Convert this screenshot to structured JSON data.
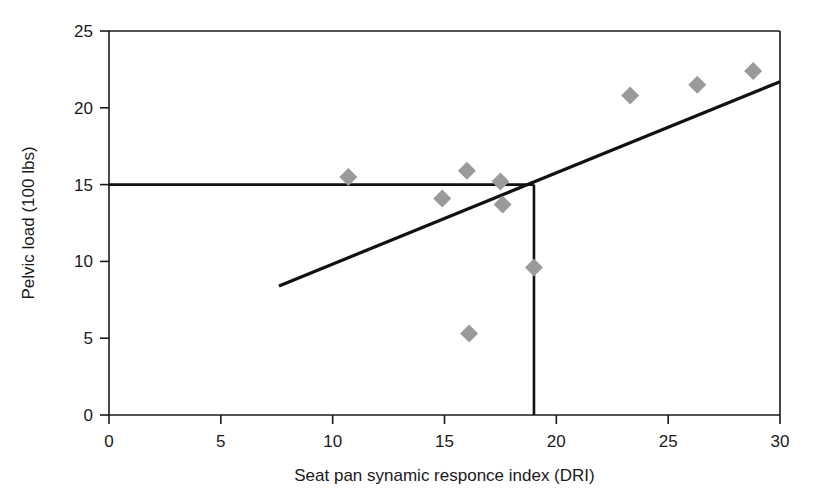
{
  "chart_data": {
    "type": "scatter",
    "title": "",
    "xlabel": "Seat pan synamic responce index (DRI)",
    "ylabel": "Pelvic load (100 lbs)",
    "xlim": [
      0,
      30
    ],
    "ylim": [
      0,
      25
    ],
    "xticks": [
      0,
      5,
      10,
      15,
      20,
      25,
      30
    ],
    "yticks": [
      0,
      5,
      10,
      15,
      20,
      25
    ],
    "xtick_labels": [
      "0",
      "5",
      "10",
      "15",
      "20",
      "25",
      "30"
    ],
    "ytick_labels": [
      "0",
      "5",
      "10",
      "15",
      "20",
      "25"
    ],
    "grid": false,
    "legend": "none",
    "marker_shape": "diamond",
    "marker_color": "#9a9a9a",
    "line_color": "#111111",
    "points": [
      {
        "x": 10.7,
        "y": 15.5
      },
      {
        "x": 14.9,
        "y": 14.1
      },
      {
        "x": 16.0,
        "y": 15.9
      },
      {
        "x": 16.1,
        "y": 5.3
      },
      {
        "x": 17.5,
        "y": 15.2
      },
      {
        "x": 17.6,
        "y": 13.7
      },
      {
        "x": 19.0,
        "y": 9.6
      },
      {
        "x": 23.3,
        "y": 20.8
      },
      {
        "x": 26.3,
        "y": 21.5
      },
      {
        "x": 28.8,
        "y": 22.4
      }
    ],
    "trend_line": {
      "name": "regression-line",
      "x_start": 7.6,
      "y_start": 8.4,
      "x_end": 30.0,
      "y_end": 21.7
    },
    "reference_lines": [
      {
        "name": "horizontal-reference",
        "orientation": "horizontal",
        "y": 15.0,
        "x_start": 0.0,
        "x_end": 19.0
      },
      {
        "name": "vertical-reference",
        "orientation": "vertical",
        "x": 19.0,
        "y_start": 0.0,
        "y_end": 15.0
      }
    ]
  }
}
